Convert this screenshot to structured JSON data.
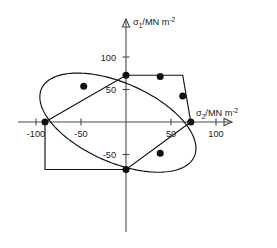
{
  "chart_data": {
    "type": "line",
    "title": "",
    "subtitle": "",
    "xlabel": "σ₂/MN m⁻²",
    "ylabel": "σ₁/MN m⁻²",
    "xlabel_parts": {
      "symbol": "σ",
      "subscript": "2",
      "unit_main": "/MN m",
      "unit_exp": "-2"
    },
    "ylabel_parts": {
      "symbol": "σ",
      "subscript": "1",
      "unit_main": "/MN m",
      "unit_exp": "-2"
    },
    "xlim": [
      -118,
      112
    ],
    "ylim": [
      -108,
      112
    ],
    "xticks": [
      -100,
      -50,
      50,
      100
    ],
    "xtick_labels": [
      "-100",
      "-50",
      "50",
      "100"
    ],
    "yticks": [
      100,
      50,
      -50
    ],
    "ytick_labels": [
      "100",
      "50",
      "-50"
    ],
    "grid": false,
    "legend": null,
    "axes_style": "arrowed-cross-through-origin",
    "series": [
      {
        "name": "Tresca yield locus (hexagon)",
        "type": "line",
        "closed": true,
        "color": "#111111",
        "points": [
          [
            -90,
            0
          ],
          [
            0,
            72
          ],
          [
            63,
            72
          ],
          [
            72,
            0
          ],
          [
            0,
            -73
          ],
          [
            -90,
            -73
          ]
        ]
      },
      {
        "name": "von Mises yield locus (ellipse)",
        "type": "line",
        "closed": true,
        "color": "#111111",
        "ellipse": {
          "cx": -9,
          "cy": -1,
          "rx": 101,
          "ry": 56,
          "rotation_deg": -38
        }
      }
    ],
    "data_points": {
      "name": "Experimental yield points",
      "color": "#111111",
      "marker": "filled-circle",
      "values": [
        [
          -90,
          0
        ],
        [
          -47,
          55
        ],
        [
          0,
          72
        ],
        [
          38,
          70
        ],
        [
          63,
          40
        ],
        [
          72,
          0
        ],
        [
          38,
          -48
        ],
        [
          0,
          -73
        ]
      ]
    }
  }
}
